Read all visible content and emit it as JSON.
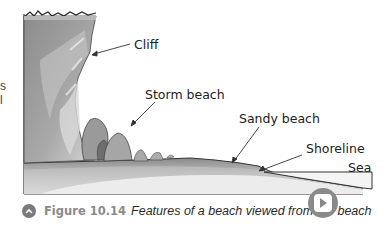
{
  "margin_fragments": [
    "s",
    "l"
  ],
  "diagram": {
    "labels": {
      "cliff": "Cliff",
      "storm_beach": "Storm beach",
      "sandy_beach": "Sandy beach",
      "shoreline": "Shoreline",
      "sea": "Sea"
    }
  },
  "caption": {
    "figure_number": "Figure 10.14",
    "text": "Features of a beach viewed from the beach",
    "icon": "chevron-up-icon"
  },
  "play_button": {
    "icon": "play-icon"
  },
  "colors": {
    "caption_gray": "#8a8a8a",
    "cliff_dark": "#8c8c8c",
    "cliff_light": "#c8c8c8",
    "sea_fill": "#f4f4f4"
  }
}
